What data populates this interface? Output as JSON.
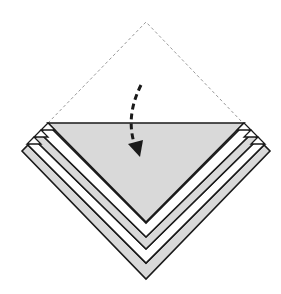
{
  "diagram": {
    "type": "origami-fold-step",
    "description": "Fold the top corner down along the horizontal edge (valley fold)",
    "colors": {
      "background": "#ffffff",
      "paper_colored": "#d9d9d9",
      "paper_white": "#ffffff",
      "outline": "#1a1a1a",
      "dashed_guide": "#9a9a9a",
      "arrow": "#1a1a1a"
    },
    "elements": [
      {
        "name": "dashed-guide-triangle",
        "meaning": "position of top flap before folding"
      },
      {
        "name": "fold-arrow",
        "meaning": "valley fold: bring top corner down"
      },
      {
        "name": "folded-layers",
        "count": 5,
        "pattern": "alternating gray / white chevron bands"
      }
    ],
    "icons": {
      "fold_arrow": "curved-dashed-arrow-down-icon"
    }
  }
}
